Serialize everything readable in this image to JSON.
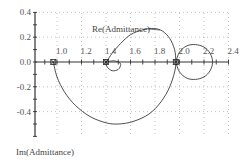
{
  "chart_data": {
    "type": "line",
    "title": "",
    "xlabel": "Re(Admittance)",
    "ylabel": "Im(Admittance)",
    "xlim": [
      0.9,
      2.4
    ],
    "ylim": [
      -0.55,
      0.4
    ],
    "x_ticks": [
      "1.0",
      "1.2",
      "1.4",
      "1.6",
      "1.8",
      "2.0",
      "2.2",
      "2.4"
    ],
    "y_ticks": [
      "0.4",
      "0.2",
      "0.0",
      "-0.2",
      "-0.4"
    ],
    "grid": true,
    "grid_style": "dotted",
    "legend": "none",
    "markers": [
      {
        "x": 0.97,
        "y": 0.0,
        "label": "x"
      },
      {
        "x": 1.4,
        "y": 0.0,
        "label": "x"
      },
      {
        "x": 1.97,
        "y": 0.0,
        "label": "x"
      }
    ],
    "series": [
      {
        "name": "Admittance locus",
        "points": [
          [
            0.97,
            0.0
          ],
          [
            1.0,
            -0.12
          ],
          [
            1.06,
            -0.24
          ],
          [
            1.15,
            -0.35
          ],
          [
            1.27,
            -0.44
          ],
          [
            1.4,
            -0.49
          ],
          [
            1.5,
            -0.5
          ],
          [
            1.62,
            -0.48
          ],
          [
            1.75,
            -0.42
          ],
          [
            1.85,
            -0.32
          ],
          [
            1.92,
            -0.2
          ],
          [
            1.96,
            -0.08
          ],
          [
            1.97,
            0.0
          ],
          [
            1.96,
            0.1
          ],
          [
            1.92,
            0.19
          ],
          [
            1.86,
            0.25
          ],
          [
            1.79,
            0.27
          ],
          [
            1.7,
            0.26
          ],
          [
            1.6,
            0.22
          ],
          [
            1.52,
            0.15
          ],
          [
            1.45,
            0.07
          ],
          [
            1.41,
            0.01
          ],
          [
            1.4,
            0.0
          ],
          [
            1.41,
            -0.04
          ],
          [
            1.45,
            -0.07
          ],
          [
            1.5,
            -0.06
          ],
          [
            1.52,
            -0.02
          ],
          [
            1.5,
            0.0
          ],
          [
            1.46,
            0.01
          ],
          [
            1.4,
            0.0
          ]
        ]
      },
      {
        "name": "Admittance locus (right loop)",
        "points": [
          [
            1.97,
            0.0
          ],
          [
            2.0,
            0.08
          ],
          [
            2.06,
            0.13
          ],
          [
            2.13,
            0.14
          ],
          [
            2.2,
            0.12
          ],
          [
            2.25,
            0.07
          ],
          [
            2.27,
            0.0
          ],
          [
            2.25,
            -0.07
          ],
          [
            2.2,
            -0.12
          ],
          [
            2.13,
            -0.14
          ],
          [
            2.06,
            -0.13
          ],
          [
            2.0,
            -0.08
          ],
          [
            1.97,
            0.0
          ]
        ]
      }
    ]
  }
}
